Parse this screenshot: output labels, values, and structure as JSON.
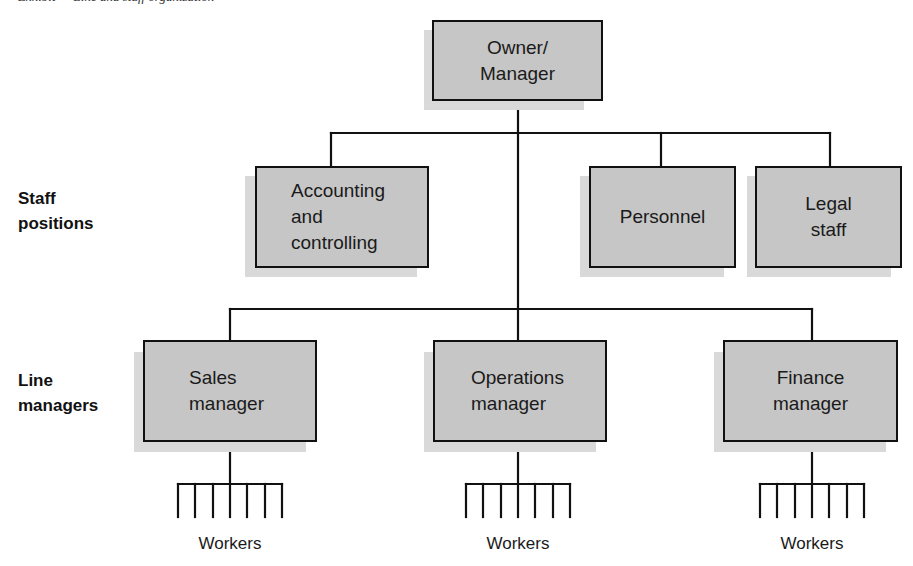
{
  "caption_fragment": "Exhibit — Line and staff organization",
  "row_labels": {
    "staff": [
      "Staff",
      "positions"
    ],
    "line": [
      "Line",
      "managers"
    ]
  },
  "top": {
    "lines": [
      "Owner/",
      "Manager"
    ]
  },
  "staff_positions": [
    {
      "id": "accounting",
      "lines": [
        "Accounting",
        "and",
        "controlling"
      ]
    },
    {
      "id": "personnel",
      "lines": [
        "Personnel"
      ]
    },
    {
      "id": "legal",
      "lines": [
        "Legal",
        "staff"
      ]
    }
  ],
  "line_managers": [
    {
      "id": "sales",
      "lines": [
        "Sales",
        "manager"
      ],
      "workers_label": "Workers"
    },
    {
      "id": "operations",
      "lines": [
        "Operations",
        "manager"
      ],
      "workers_label": "Workers"
    },
    {
      "id": "finance",
      "lines": [
        "Finance",
        "manager"
      ],
      "workers_label": "Workers"
    }
  ],
  "workers_per_group": 7,
  "colors": {
    "box_fill": "#c6c6c6",
    "box_shadow": "#d9d9d9",
    "line": "#111111"
  }
}
